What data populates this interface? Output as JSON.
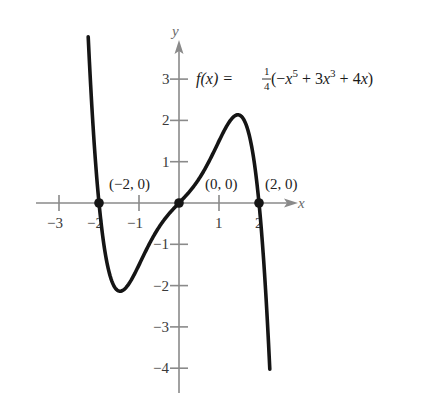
{
  "chart_data": {
    "type": "line",
    "title": "",
    "function_label": "f(x) = 1/4 (−x^5 + 3x^3 + 4x)",
    "formula": {
      "lhs": "f(x) = ",
      "frac_num": "1",
      "frac_den": "4",
      "open": " (−",
      "x1": "x",
      "e1": "5",
      "mid1": " + 3",
      "x2": "x",
      "e2": "3",
      "mid2": " + 4",
      "x3": "x",
      "close": ")"
    },
    "coefficients": {
      "x5": -0.25,
      "x3": 0.75,
      "x1": 1.0
    },
    "x_domain": [
      -2.27,
      2.27
    ],
    "xlabel": "x",
    "ylabel": "y",
    "xlim": [
      -3.6,
      3.0
    ],
    "ylim": [
      -4.6,
      4.0
    ],
    "x_ticks": [
      -3,
      -2,
      -1,
      1,
      2
    ],
    "x_tick_labels": [
      "−3",
      "−2",
      "−1",
      "1",
      "2"
    ],
    "y_ticks": [
      -4,
      -3,
      -2,
      -1,
      1,
      2,
      3
    ],
    "y_tick_labels": [
      "−4",
      "−3",
      "−2",
      "−1",
      "1",
      "2",
      "3"
    ],
    "grid": false,
    "points": [
      {
        "x": -2,
        "y": 0,
        "label": "(−2, 0)"
      },
      {
        "x": 0,
        "y": 0,
        "label": "(0, 0)"
      },
      {
        "x": 2,
        "y": 0,
        "label": "(2, 0)"
      }
    ],
    "extrema": {
      "local_max": {
        "x": 1.5,
        "y": 2.13
      },
      "local_min": {
        "x": -1.5,
        "y": -2.13
      }
    },
    "colors": {
      "curve": "#151515",
      "axis": "#8a8a8a"
    }
  }
}
